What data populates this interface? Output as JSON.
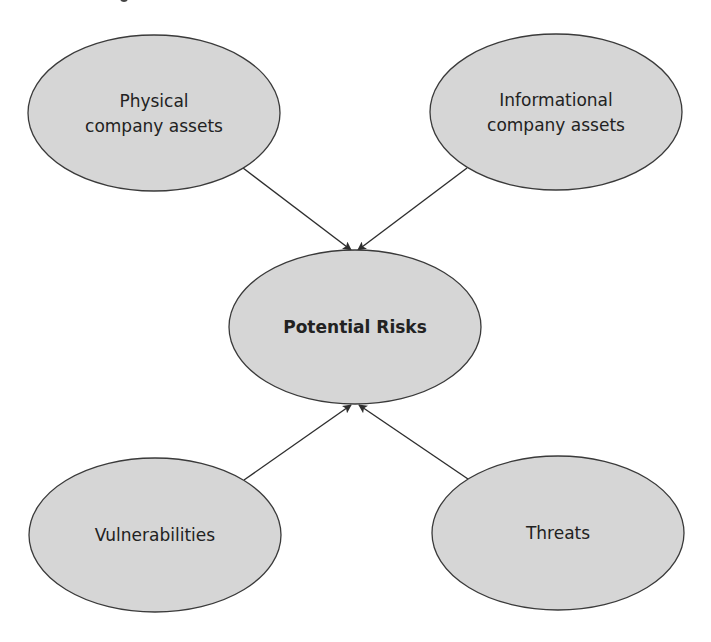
{
  "diagram": {
    "colors": {
      "background": "#ffffff",
      "node_fill": "#d6d6d6",
      "node_stroke": "#3a3a3a",
      "edge": "#2e2e2e",
      "text": "#222222"
    },
    "nodes": [
      {
        "id": "physical",
        "lines": [
          "Physical",
          "company assets"
        ],
        "bold": false,
        "cx": 154,
        "cy": 113,
        "rx": 126,
        "ry": 78
      },
      {
        "id": "informational",
        "lines": [
          "Informational",
          "company assets"
        ],
        "bold": false,
        "cx": 556,
        "cy": 112,
        "rx": 126,
        "ry": 78
      },
      {
        "id": "risks",
        "lines": [
          "Potential Risks"
        ],
        "bold": true,
        "cx": 355,
        "cy": 327,
        "rx": 126,
        "ry": 77
      },
      {
        "id": "vulnerabilities",
        "lines": [
          "Vulnerabilities"
        ],
        "bold": false,
        "cx": 155,
        "cy": 535,
        "rx": 126,
        "ry": 77
      },
      {
        "id": "threats",
        "lines": [
          "Threats"
        ],
        "bold": false,
        "cx": 558,
        "cy": 533,
        "rx": 126,
        "ry": 77
      }
    ],
    "edges": [
      {
        "from": "physical",
        "to": "risks",
        "x1": 243,
        "y1": 168,
        "x2": 351,
        "y2": 250
      },
      {
        "from": "informational",
        "to": "risks",
        "x1": 467,
        "y1": 168,
        "x2": 358,
        "y2": 250
      },
      {
        "from": "vulnerabilities",
        "to": "risks",
        "x1": 244,
        "y1": 480,
        "x2": 351,
        "y2": 405
      },
      {
        "from": "threats",
        "to": "risks",
        "x1": 468,
        "y1": 479,
        "x2": 359,
        "y2": 405
      }
    ]
  }
}
